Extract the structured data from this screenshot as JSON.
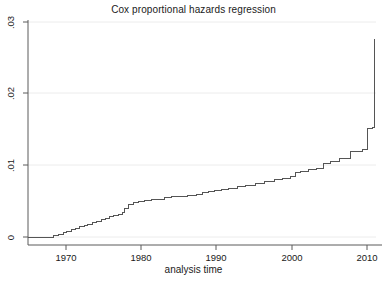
{
  "chart_data": {
    "type": "line",
    "subtype": "step",
    "title": "Cox proportional hazards regression",
    "xlabel": "analysis time",
    "ylabel": "",
    "xlim": [
      1965.6,
      2010.3
    ],
    "ylim": [
      0,
      0.03
    ],
    "xticks": [
      1970,
      1980,
      1990,
      2000,
      2010
    ],
    "xtick_labels": [
      "1970",
      "1980",
      "1990",
      "2000",
      "2010"
    ],
    "yticks": [
      0,
      0.01,
      0.02,
      0.03
    ],
    "ytick_labels": [
      "0",
      ".01",
      ".02",
      ".03"
    ],
    "grid": "horizontal-faint",
    "legend": "none",
    "series": [
      {
        "name": "cumulative baseline hazard",
        "x": [
          1965.6,
          1968.2,
          1968.9,
          1969.5,
          1970.1,
          1970.6,
          1971.2,
          1971.7,
          1972.2,
          1972.8,
          1973.3,
          1973.9,
          1974.4,
          1975.0,
          1975.5,
          1976.1,
          1976.6,
          1977.2,
          1977.7,
          1978.0,
          1978.5,
          1979.1,
          1979.8,
          1980.6,
          1981.4,
          1982.2,
          1983.1,
          1984.0,
          1985.0,
          1986.1,
          1987.2,
          1988.0,
          1988.8,
          1989.6,
          1990.4,
          1991.4,
          1992.5,
          1993.6,
          1994.8,
          1996.0,
          1997.2,
          1998.3,
          1999.3,
          1999.9,
          2000.6,
          2001.6,
          2002.6,
          2003.6,
          2004.4,
          2005.6,
          2007.0,
          2008.6,
          2009.2,
          2009.9,
          2010.1
        ],
        "y": [
          0.0,
          0.0,
          0.0002,
          0.0004,
          0.0006,
          0.0008,
          0.001,
          0.0012,
          0.0014,
          0.0016,
          0.0018,
          0.002,
          0.0022,
          0.0024,
          0.0026,
          0.0028,
          0.003,
          0.0032,
          0.0034,
          0.004,
          0.0046,
          0.0048,
          0.005,
          0.0051,
          0.0052,
          0.0053,
          0.0055,
          0.0056,
          0.0057,
          0.0058,
          0.006,
          0.0062,
          0.0064,
          0.0065,
          0.0066,
          0.0067,
          0.007,
          0.0072,
          0.0074,
          0.0077,
          0.008,
          0.0082,
          0.0084,
          0.009,
          0.0092,
          0.0094,
          0.0096,
          0.0102,
          0.0106,
          0.011,
          0.012,
          0.0122,
          0.0152,
          0.0153,
          0.0276
        ]
      }
    ],
    "colors": {
      "line": "#555555",
      "axis": "#555555",
      "grid": "#ebebeb",
      "text": "#1a1a1a",
      "background": "#ffffff"
    }
  },
  "geometry": {
    "plot_left": 28,
    "plot_right": 376,
    "plot_top": 22,
    "plot_bottom": 237,
    "axis_bottom_y": 245,
    "x_1970_px": 66,
    "x_2010_px": 367,
    "px_per_year": 7.525,
    "y_0_px": 237,
    "y_003_px": 22
  }
}
